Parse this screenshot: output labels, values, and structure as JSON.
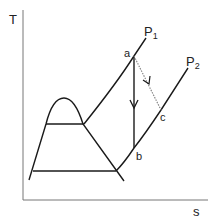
{
  "diagram": {
    "type": "T-s diagram",
    "axes": {
      "y_label": "T",
      "x_label": "s"
    },
    "isobars": [
      {
        "name": "P",
        "subscript": "1"
      },
      {
        "name": "P",
        "subscript": "2"
      }
    ],
    "points": {
      "a": "a",
      "b": "b",
      "c": "c"
    },
    "processes": [
      {
        "from": "a",
        "to": "b",
        "style": "solid",
        "description": "isentropic expansion"
      },
      {
        "from": "a",
        "to": "c",
        "style": "dotted",
        "description": "actual expansion"
      }
    ],
    "colors": {
      "line": "#1a1a1a",
      "axis": "#777777",
      "dotted": "#888888"
    }
  }
}
